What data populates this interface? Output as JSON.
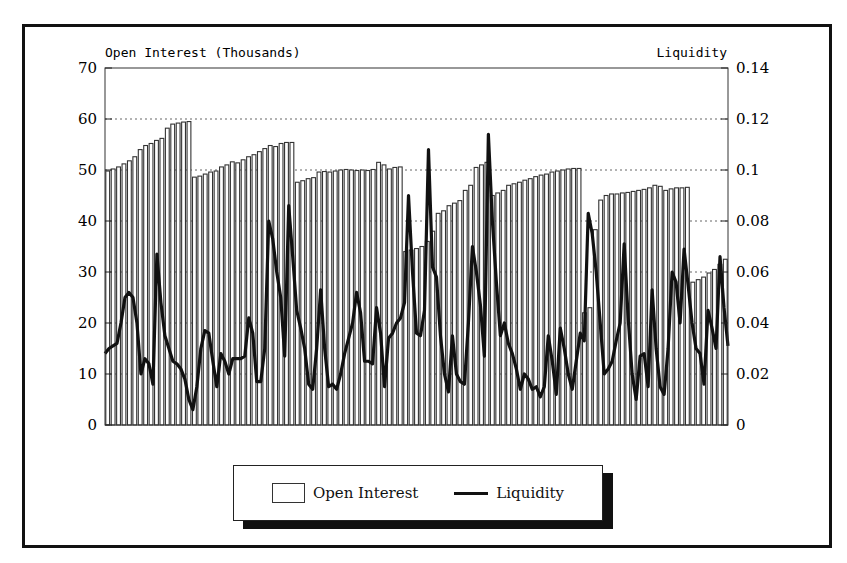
{
  "chart_data": {
    "type": "bar+line",
    "title": "",
    "left_axis": {
      "label": "Open Interest (Thousands)",
      "range": [
        0,
        70
      ],
      "ticks": [
        0,
        10,
        20,
        30,
        40,
        50,
        60,
        70
      ],
      "tick_labels": [
        "0",
        "10",
        "20",
        "30",
        "40",
        "50",
        "60",
        "70"
      ]
    },
    "right_axis": {
      "label": "Liquidity",
      "range": [
        0,
        0.14
      ],
      "ticks": [
        0,
        0.02,
        0.04,
        0.06,
        0.08,
        0.1,
        0.12,
        0.14
      ],
      "tick_labels": [
        "0",
        "0.02",
        "0.04",
        "0.06",
        "0.08",
        "0.1",
        "0.12",
        "0.14"
      ]
    },
    "xlabel": "",
    "grid": "horizontal dotted",
    "legend": {
      "position": "bottom-center",
      "entries": [
        {
          "label": "Open Interest",
          "type": "bar"
        },
        {
          "label": "Liquidity",
          "type": "line"
        }
      ]
    },
    "series": [
      {
        "name": "Open Interest",
        "axis": "left",
        "type": "bar",
        "values": [
          49.8,
          50.2,
          50.6,
          51.2,
          51.8,
          52.6,
          54,
          54.8,
          55.2,
          55.8,
          56.2,
          58.2,
          59,
          59.2,
          59.4,
          59.5,
          48.6,
          48.8,
          49.2,
          49.6,
          49.8,
          50.6,
          51,
          51.6,
          51.4,
          52,
          52.6,
          53,
          53.6,
          54.2,
          54.8,
          54.6,
          55.2,
          55.4,
          55.4,
          47.6,
          47.9,
          48.3,
          48.5,
          49.6,
          49.7,
          49.6,
          49.8,
          50,
          50.1,
          50,
          49.9,
          50,
          49.9,
          50.1,
          51.5,
          51,
          50.2,
          50.5,
          50.6,
          34,
          34.3,
          34.6,
          35,
          36,
          38,
          41.5,
          42,
          43,
          43.5,
          44,
          46,
          47,
          50.5,
          51,
          51.5,
          45,
          45.5,
          46,
          47,
          47.3,
          47.6,
          48,
          48.3,
          48.7,
          49,
          49.2,
          49.6,
          49.8,
          50,
          50.2,
          50.3,
          50.3,
          22,
          23,
          38.3,
          44.1,
          45,
          45.3,
          45.3,
          45.5,
          45.6,
          45.8,
          46,
          46.2,
          46.5,
          47,
          46.8,
          46,
          46.3,
          46.5,
          46.5,
          46.6,
          28,
          28.5,
          29,
          29.8,
          30.5,
          31.5,
          32.5
        ]
      },
      {
        "name": "Liquidity",
        "axis": "right",
        "type": "line",
        "values": [
          0.028,
          0.03,
          0.031,
          0.032,
          0.04,
          0.05,
          0.052,
          0.05,
          0.04,
          0.02,
          0.026,
          0.024,
          0.016,
          0.067,
          0.048,
          0.035,
          0.03,
          0.025,
          0.024,
          0.022,
          0.018,
          0.01,
          0.006,
          0.015,
          0.03,
          0.037,
          0.036,
          0.025,
          0.015,
          0.028,
          0.025,
          0.02,
          0.026,
          0.026,
          0.026,
          0.027,
          0.042,
          0.036,
          0.017,
          0.017,
          0.03,
          0.08,
          0.073,
          0.06,
          0.05,
          0.027,
          0.086,
          0.066,
          0.045,
          0.038,
          0.03,
          0.016,
          0.014,
          0.03,
          0.053,
          0.03,
          0.015,
          0.016,
          0.014,
          0.02,
          0.028,
          0.034,
          0.04,
          0.052,
          0.044,
          0.025,
          0.025,
          0.024,
          0.046,
          0.036,
          0.015,
          0.034,
          0.036,
          0.04,
          0.042,
          0.048,
          0.09,
          0.06,
          0.036,
          0.035,
          0.045,
          0.108,
          0.062,
          0.058,
          0.035,
          0.02,
          0.013,
          0.035,
          0.02,
          0.017,
          0.016,
          0.04,
          0.07,
          0.06,
          0.047,
          0.027,
          0.114,
          0.08,
          0.056,
          0.035,
          0.04,
          0.032,
          0.028,
          0.022,
          0.014,
          0.02,
          0.018,
          0.014,
          0.015,
          0.011,
          0.015,
          0.035,
          0.025,
          0.012,
          0.038,
          0.03,
          0.02,
          0.014,
          0.025,
          0.036,
          0.033,
          0.083,
          0.075,
          0.06,
          0.04,
          0.02,
          0.022,
          0.025,
          0.033,
          0.04,
          0.071,
          0.042,
          0.02,
          0.01,
          0.027,
          0.028,
          0.015,
          0.053,
          0.03,
          0.015,
          0.012,
          0.03,
          0.06,
          0.056,
          0.04,
          0.069,
          0.055,
          0.04,
          0.03,
          0.028,
          0.016,
          0.045,
          0.038,
          0.03,
          0.066,
          0.046,
          0.031
        ]
      }
    ]
  }
}
